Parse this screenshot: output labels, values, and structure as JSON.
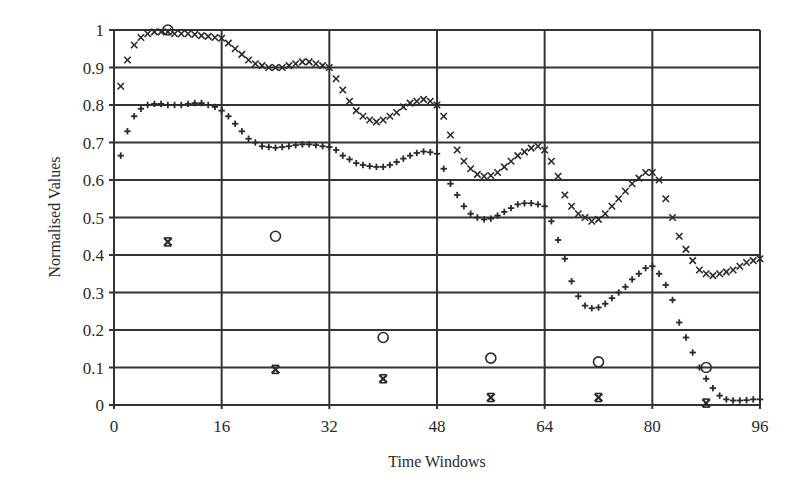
{
  "chart_data": {
    "type": "scatter",
    "title": "",
    "xlabel": "Time Windows",
    "ylabel": "Normalised Values",
    "xlim": [
      0,
      96
    ],
    "ylim": [
      0,
      1
    ],
    "xticks": [
      0,
      16,
      32,
      48,
      64,
      80,
      96
    ],
    "yticks": [
      0,
      0.1,
      0.2,
      0.3,
      0.4,
      0.5,
      0.6,
      0.7,
      0.8,
      0.9,
      1
    ],
    "ytick_labels": [
      "0",
      "0.1",
      "0.2",
      "0.3",
      "0.4",
      "0.5",
      "0.6",
      "0.7",
      "0.8",
      "0.9",
      "1"
    ],
    "grid": true,
    "legend": null,
    "series": [
      {
        "name": "upper curve (x markers)",
        "marker": "x",
        "x": [
          1,
          2,
          3,
          4,
          5,
          6,
          7,
          8,
          9,
          10,
          11,
          12,
          13,
          14,
          15,
          16,
          17,
          18,
          19,
          20,
          21,
          22,
          23,
          24,
          25,
          26,
          27,
          28,
          29,
          30,
          31,
          32,
          33,
          34,
          35,
          36,
          37,
          38,
          39,
          40,
          41,
          42,
          43,
          44,
          45,
          46,
          47,
          48,
          49,
          50,
          51,
          52,
          53,
          54,
          55,
          56,
          57,
          58,
          59,
          60,
          61,
          62,
          63,
          64,
          65,
          66,
          67,
          68,
          69,
          70,
          71,
          72,
          73,
          74,
          75,
          76,
          77,
          78,
          79,
          80,
          81,
          82,
          83,
          84,
          85,
          86,
          87,
          88,
          89,
          90,
          91,
          92,
          93,
          94,
          95,
          96
        ],
        "y": [
          0.85,
          0.92,
          0.96,
          0.98,
          0.99,
          0.995,
          0.995,
          0.995,
          0.99,
          0.99,
          0.99,
          0.988,
          0.985,
          0.983,
          0.98,
          0.978,
          0.965,
          0.95,
          0.935,
          0.92,
          0.91,
          0.905,
          0.9,
          0.9,
          0.9,
          0.905,
          0.91,
          0.915,
          0.915,
          0.91,
          0.905,
          0.9,
          0.87,
          0.84,
          0.81,
          0.785,
          0.77,
          0.76,
          0.755,
          0.76,
          0.77,
          0.78,
          0.795,
          0.805,
          0.81,
          0.815,
          0.81,
          0.8,
          0.77,
          0.72,
          0.68,
          0.65,
          0.63,
          0.615,
          0.61,
          0.612,
          0.62,
          0.635,
          0.65,
          0.665,
          0.675,
          0.685,
          0.69,
          0.68,
          0.65,
          0.61,
          0.56,
          0.53,
          0.51,
          0.5,
          0.49,
          0.495,
          0.51,
          0.53,
          0.55,
          0.57,
          0.59,
          0.605,
          0.62,
          0.62,
          0.6,
          0.55,
          0.5,
          0.45,
          0.415,
          0.385,
          0.36,
          0.35,
          0.345,
          0.35,
          0.355,
          0.36,
          0.37,
          0.38,
          0.385,
          0.39
        ]
      },
      {
        "name": "lower curve (+ markers)",
        "marker": "+",
        "x": [
          1,
          2,
          3,
          4,
          5,
          6,
          7,
          8,
          9,
          10,
          11,
          12,
          13,
          14,
          15,
          16,
          17,
          18,
          19,
          20,
          21,
          22,
          23,
          24,
          25,
          26,
          27,
          28,
          29,
          30,
          31,
          32,
          33,
          34,
          35,
          36,
          37,
          38,
          39,
          40,
          41,
          42,
          43,
          44,
          45,
          46,
          47,
          48,
          49,
          50,
          51,
          52,
          53,
          54,
          55,
          56,
          57,
          58,
          59,
          60,
          61,
          62,
          63,
          64,
          65,
          66,
          67,
          68,
          69,
          70,
          71,
          72,
          73,
          74,
          75,
          76,
          77,
          78,
          79,
          80,
          81,
          82,
          83,
          84,
          85,
          86,
          87,
          88,
          89,
          90,
          91,
          92,
          93,
          94,
          95,
          96
        ],
        "y": [
          0.665,
          0.73,
          0.77,
          0.79,
          0.8,
          0.803,
          0.803,
          0.8,
          0.8,
          0.8,
          0.803,
          0.805,
          0.805,
          0.8,
          0.795,
          0.785,
          0.77,
          0.75,
          0.73,
          0.71,
          0.7,
          0.69,
          0.688,
          0.686,
          0.688,
          0.69,
          0.693,
          0.695,
          0.695,
          0.693,
          0.69,
          0.688,
          0.68,
          0.665,
          0.655,
          0.645,
          0.64,
          0.637,
          0.635,
          0.635,
          0.64,
          0.648,
          0.657,
          0.665,
          0.672,
          0.676,
          0.674,
          0.67,
          0.63,
          0.59,
          0.56,
          0.53,
          0.51,
          0.5,
          0.495,
          0.497,
          0.505,
          0.515,
          0.525,
          0.535,
          0.538,
          0.538,
          0.535,
          0.53,
          0.49,
          0.44,
          0.39,
          0.33,
          0.29,
          0.265,
          0.258,
          0.26,
          0.27,
          0.285,
          0.3,
          0.315,
          0.335,
          0.35,
          0.365,
          0.37,
          0.35,
          0.32,
          0.28,
          0.22,
          0.18,
          0.14,
          0.1,
          0.07,
          0.045,
          0.025,
          0.015,
          0.012,
          0.012,
          0.013,
          0.015,
          0.015
        ]
      },
      {
        "name": "circle markers",
        "marker": "o",
        "x": [
          8,
          24,
          40,
          56,
          72,
          88
        ],
        "y": [
          1.0,
          0.45,
          0.18,
          0.125,
          0.115,
          0.1
        ]
      },
      {
        "name": "asterisk markers",
        "marker": "*",
        "x": [
          8,
          24,
          40,
          56,
          72,
          88
        ],
        "y": [
          0.435,
          0.095,
          0.07,
          0.02,
          0.02,
          0.005
        ]
      }
    ]
  },
  "axes": {
    "xlabel": "Time Windows",
    "ylabel": "Normalised Values"
  }
}
